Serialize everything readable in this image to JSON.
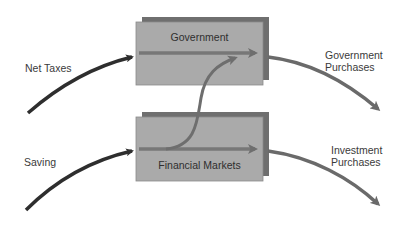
{
  "diagram": {
    "nodes": [
      {
        "id": "government",
        "label": "Government"
      },
      {
        "id": "financial_markets",
        "label": "Financial Markets"
      }
    ],
    "flows": [
      {
        "id": "net_taxes",
        "label": "Net Taxes",
        "to": "government"
      },
      {
        "id": "saving",
        "label": "Saving",
        "to": "financial_markets"
      },
      {
        "id": "government_purchases",
        "label_line1": "Government",
        "label_line2": "Purchases",
        "from": "government"
      },
      {
        "id": "investment_purchases",
        "label_line1": "Investment",
        "label_line2": "Purchases",
        "from": "financial_markets"
      },
      {
        "id": "borrowing",
        "from": "financial_markets",
        "to": "government"
      }
    ],
    "colors": {
      "box_face": "#a9a9a9",
      "box_shadow": "#707070",
      "inflow_arrow": "#2e2e2e",
      "outflow_arrow": "#6a6a6a",
      "through_arrow": "#777777"
    }
  }
}
